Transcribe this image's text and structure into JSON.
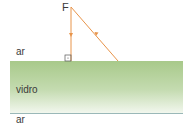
{
  "diagram": {
    "source_label": "F",
    "media": {
      "top": "ar",
      "middle": "vidro",
      "bottom": "ar"
    },
    "colors": {
      "ray": "#e8944a",
      "glass_top": "#a8c98a",
      "glass_bottom": "#f2f7ee",
      "interface_line": "#9ab8b8",
      "text": "#3a3a3a"
    },
    "rays": [
      {
        "name": "normal-incidence-ray",
        "from": [
          71,
          7
        ],
        "to": [
          71,
          61
        ],
        "arrow": "down"
      },
      {
        "name": "reflected-ray",
        "from": [
          118,
          61
        ],
        "to": [
          71,
          7
        ],
        "arrow": "up-left"
      }
    ],
    "right_angle_marker": true
  }
}
